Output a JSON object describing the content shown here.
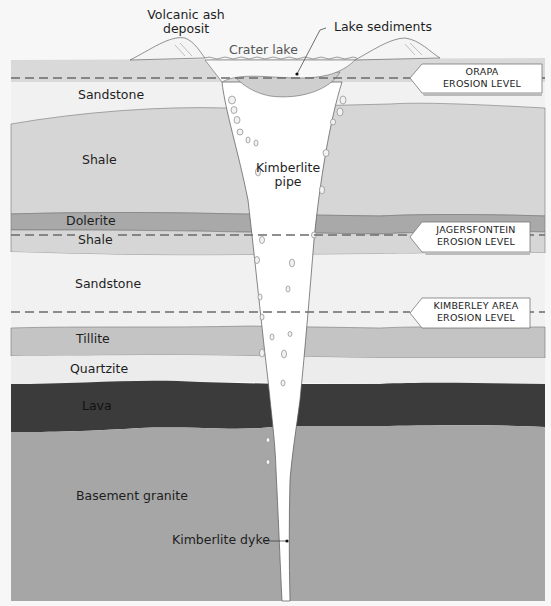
{
  "colors": {
    "background": "#f7f7f7",
    "sandstone": "#f1f1f1",
    "shale": "#d6d6d6",
    "dolerite": "#a9a9a9",
    "tillite": "#c4c4c4",
    "quartzite": "#ececec",
    "lava": "#3b3b3b",
    "granite": "#a6a6a6",
    "pipe": "#ffffff",
    "outline": "#666666",
    "dashed_line": "#6b6b6b"
  },
  "surface_labels": {
    "volcanic_ash_line1": "Volcanic ash",
    "volcanic_ash_line2": "deposit",
    "crater_lake": "Crater lake",
    "lake_sediments": "Lake sediments"
  },
  "pipe_labels": {
    "pipe_line1": "Kimberlite",
    "pipe_line2": "pipe",
    "dyke": "Kimberlite dyke"
  },
  "layers": [
    {
      "name": "Sandstone",
      "color": "#f1f1f1"
    },
    {
      "name": "Shale",
      "color": "#d6d6d6"
    },
    {
      "name": "Dolerite",
      "color": "#a9a9a9"
    },
    {
      "name": "Shale",
      "color": "#d6d6d6"
    },
    {
      "name": "Sandstone",
      "color": "#f1f1f1"
    },
    {
      "name": "Tillite",
      "color": "#c4c4c4"
    },
    {
      "name": "Quartzite",
      "color": "#ececec"
    },
    {
      "name": "Lava",
      "color": "#3b3b3b"
    },
    {
      "name": "Basement granite",
      "color": "#a6a6a6"
    }
  ],
  "erosion_levels": [
    {
      "line1": "ORAPA",
      "line2": "EROSION LEVEL"
    },
    {
      "line1": "JAGERSFONTEIN",
      "line2": "EROSION LEVEL"
    },
    {
      "line1": "KIMBERLEY AREA",
      "line2": "EROSION LEVEL"
    }
  ]
}
